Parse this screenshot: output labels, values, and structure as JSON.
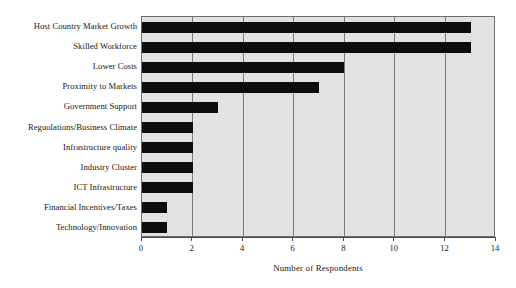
{
  "figure": {
    "title_remnant": "",
    "background_color": "#ffffff",
    "plot_background_color": "#e2e2e2",
    "bar_color": "#0d0d0d",
    "grid_color": "#7b7b7b",
    "axis_color": "#4a4a4a"
  },
  "chart_data": {
    "type": "bar",
    "orientation": "horizontal",
    "title": "",
    "xlabel": "Number of Respondents",
    "ylabel": "",
    "xlim": [
      0,
      14
    ],
    "xticks": [
      0,
      2,
      4,
      6,
      8,
      10,
      12,
      14
    ],
    "xtick_labels": [
      "0",
      "2",
      "4",
      "6",
      "8",
      "10",
      "12",
      "14"
    ],
    "grid": true,
    "grid_axis": "x",
    "legend": false,
    "categories": [
      "Host Country Market Growth",
      "Skilled Workforce",
      "Lower Costs",
      "Proximity to Markets",
      "Government Support",
      "Reguolations/Business Climate",
      "Infrastructure quality",
      "Industry Cluster",
      "ICT Infrastructure",
      "Financial Incentives/Taxes",
      "Technology/Innovation"
    ],
    "values": [
      13,
      13,
      8,
      7,
      3,
      2,
      2,
      2,
      2,
      1,
      1
    ]
  }
}
